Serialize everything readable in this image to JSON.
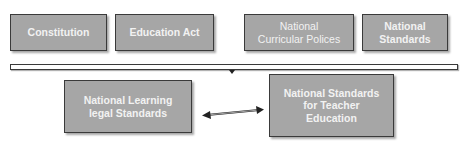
{
  "diagram": {
    "cut_off_title": "",
    "colors": {
      "box_fill": "#a6a6a6",
      "box_border": "#3a3a3a",
      "box_text": "#f2f2f2",
      "background": "#ffffff"
    },
    "top_row": [
      {
        "label": "Constitution"
      },
      {
        "label": "Education Act"
      },
      {
        "label_line1": "National",
        "label_line2": "Curricular Polices"
      },
      {
        "label_line1": "National",
        "label_line2": "Standards"
      }
    ],
    "bottom_row": {
      "left": {
        "label_line1": "National Learning",
        "label_line2": "legal Standards"
      },
      "right": {
        "label_line1": "National Standards",
        "label_line2": "for Teacher",
        "label_line3": "Education"
      }
    },
    "connector": {
      "type": "double-headed-arrow"
    }
  }
}
